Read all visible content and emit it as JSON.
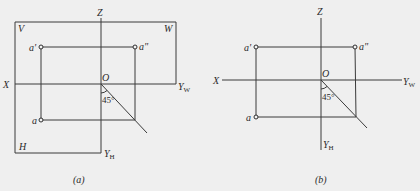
{
  "figure": {
    "colors": {
      "background": "#efefef",
      "line": "#3a3a3a",
      "text": "#2a2a2a"
    },
    "panels": [
      {
        "id": "a",
        "caption": "(a)",
        "plane_labels": {
          "V": "V",
          "W": "W",
          "H": "H"
        },
        "axis_labels": {
          "Z": "Z",
          "X": "X",
          "O": "O",
          "Y": "Y",
          "YW_sub": "W",
          "YH_sub": "H"
        },
        "points": {
          "front": "a'",
          "side": "a\"",
          "top": "a"
        },
        "angle_label": "45°"
      },
      {
        "id": "b",
        "caption": "(b)",
        "axis_labels": {
          "Z": "Z",
          "X": "X",
          "O": "O",
          "Y": "Y",
          "YW_sub": "W",
          "YH_sub": "H"
        },
        "points": {
          "front": "a'",
          "side": "a\"",
          "top": "a"
        },
        "angle_label": "45°"
      }
    ]
  }
}
